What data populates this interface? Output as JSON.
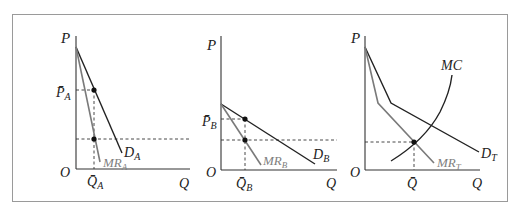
{
  "figure": {
    "panels": [
      {
        "id": "A",
        "axis_y_label": "P",
        "axis_x_label": "Q",
        "origin_label": "O",
        "price_label": "P̄",
        "price_sub": "A",
        "qty_label": "Q̄",
        "qty_sub": "A",
        "demand_label": "D",
        "demand_sub": "A",
        "mr_label": "MR",
        "mr_sub": "A"
      },
      {
        "id": "B",
        "axis_y_label": "P",
        "axis_x_label": "Q",
        "origin_label": "O",
        "price_label": "P̄",
        "price_sub": "B",
        "qty_label": "Q̄",
        "qty_sub": "B",
        "demand_label": "D",
        "demand_sub": "B",
        "mr_label": "MR",
        "mr_sub": "B"
      },
      {
        "id": "T",
        "axis_y_label": "P",
        "axis_x_label": "Q",
        "origin_label": "O",
        "qty_label": "Q̄",
        "demand_label": "D",
        "demand_sub": "T",
        "mr_label": "MR",
        "mr_sub": "T",
        "mc_label": "MC"
      }
    ],
    "colors": {
      "demand": "#222222",
      "marginal_revenue": "#7a7a7a",
      "border": "#9a9a9a"
    }
  }
}
